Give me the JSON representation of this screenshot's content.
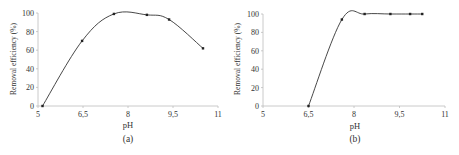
{
  "chart_data": [
    {
      "type": "line",
      "panel_label": "(a)",
      "title": "",
      "xlabel": "pH",
      "ylabel": "Removal efficiency (%)",
      "xlim": [
        5,
        11
      ],
      "ylim": [
        0,
        100
      ],
      "xticks": [
        "5",
        "6,5",
        "8",
        "9,5",
        "11"
      ],
      "xtick_values": [
        5,
        6.5,
        8,
        9.5,
        11
      ],
      "yticks": [
        "0",
        "20",
        "40",
        "60",
        "80",
        "100"
      ],
      "ytick_values": [
        0,
        20,
        40,
        60,
        80,
        100
      ],
      "grid": false,
      "legend": null,
      "smooth": true,
      "series": [
        {
          "name": "Removal efficiency",
          "x": [
            5.15,
            6.47,
            7.53,
            8.63,
            9.37,
            10.5
          ],
          "y": [
            0,
            70,
            99,
            98,
            93,
            62
          ]
        }
      ]
    },
    {
      "type": "line",
      "panel_label": "(b)",
      "title": "",
      "xlabel": "pH",
      "ylabel": "Removal efficiency (%)",
      "xlim": [
        5,
        11
      ],
      "ylim": [
        0,
        100
      ],
      "xticks": [
        "5",
        "6,5",
        "8",
        "9,5",
        "11"
      ],
      "xtick_values": [
        5,
        6.5,
        8,
        9.5,
        11
      ],
      "yticks": [
        "0",
        "20",
        "40",
        "60",
        "80",
        "100"
      ],
      "ytick_values": [
        0,
        20,
        40,
        60,
        80,
        100
      ],
      "grid": false,
      "legend": null,
      "smooth": true,
      "series": [
        {
          "name": "Removal efficiency",
          "x": [
            6.5,
            7.6,
            8.35,
            9.2,
            9.85,
            10.25
          ],
          "y": [
            0,
            94,
            100,
            100,
            100,
            100
          ]
        }
      ]
    }
  ],
  "panels": [
    {
      "label": "(a)",
      "xlabel": "pH",
      "ylabel": "Removal  efficiency  (%)"
    },
    {
      "label": "(b)",
      "xlabel": "pH",
      "ylabel": "Removal  efficiency  (%)"
    }
  ]
}
